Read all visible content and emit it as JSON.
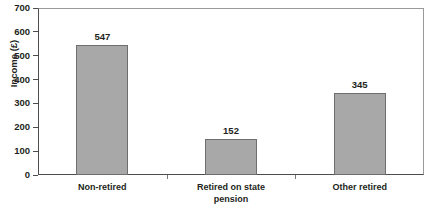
{
  "chart_data": {
    "type": "bar",
    "title": "",
    "xlabel": "",
    "ylabel": "Income (£)",
    "categories": [
      "Non-retired",
      "Retired on state pension",
      "Other retired"
    ],
    "category_lines": [
      [
        "Non-retired"
      ],
      [
        "Retired on state",
        "pension"
      ],
      [
        "Other retired"
      ]
    ],
    "values": [
      547,
      152,
      345
    ],
    "value_labels": [
      "547",
      "152",
      "345"
    ],
    "ylim": [
      0,
      700
    ],
    "ytick_step": 100,
    "ytick_labels": [
      "700",
      "600",
      "500",
      "400",
      "300",
      "200",
      "100",
      "0"
    ],
    "ytick_values": [
      700,
      600,
      500,
      400,
      300,
      200,
      100,
      0
    ],
    "grid": false,
    "legend": false,
    "bar_color": "#a8a8a8",
    "bar_border_color": "#6e6e6e",
    "axis_color": "#4d4d4d",
    "frame_color": "#9a9a9a",
    "text_color": "#231f20",
    "background": "#ffffff"
  }
}
